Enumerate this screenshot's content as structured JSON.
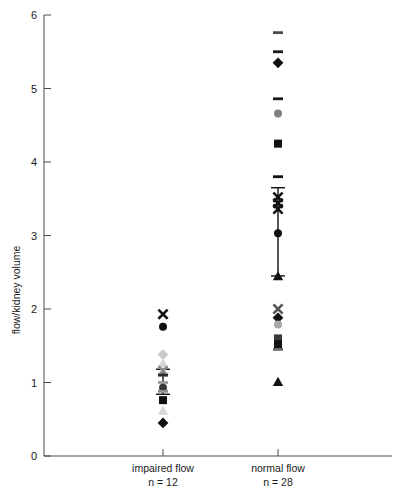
{
  "chart_data": {
    "type": "scatter",
    "title": "",
    "xlabel": "",
    "ylabel": "flow/kidney volume",
    "ylim": [
      0,
      6
    ],
    "yticks": [
      0,
      1,
      2,
      3,
      4,
      5,
      6
    ],
    "ytick_labels": [
      "0",
      "1",
      "2",
      "3",
      "4",
      "5",
      "6"
    ],
    "grid": false,
    "legend": "none",
    "categories": [
      "impaired flow",
      "normal flow"
    ],
    "category_sublabels": [
      "n = 12",
      "n = 28"
    ],
    "groups": [
      {
        "name": "impaired flow",
        "n": 12,
        "x_position": 163,
        "points": [
          {
            "value": 1.93,
            "marker": "x",
            "color": "#111111"
          },
          {
            "value": 1.76,
            "marker": "circle",
            "color": "#111111"
          },
          {
            "value": 1.38,
            "marker": "diamond",
            "color": "#c9c9c9"
          },
          {
            "value": 1.26,
            "marker": "triangle",
            "color": "#d5d5d5"
          },
          {
            "value": 1.16,
            "marker": "x",
            "color": "#8a8a8a"
          },
          {
            "value": 1.1,
            "marker": "dash",
            "color": "#2b2b2b"
          },
          {
            "value": 1.0,
            "marker": "dash",
            "color": "#9a9a9a"
          },
          {
            "value": 0.93,
            "marker": "circle",
            "color": "#3a3a3a"
          },
          {
            "value": 0.88,
            "marker": "dash",
            "color": "#8f8f8f"
          },
          {
            "value": 0.76,
            "marker": "square",
            "color": "#111111"
          },
          {
            "value": 0.62,
            "marker": "triangle",
            "color": "#d8d8d8"
          },
          {
            "value": 0.45,
            "marker": "diamond",
            "color": "#111111"
          }
        ],
        "error_bar": {
          "mean": 1.02,
          "upper": 1.18,
          "lower": 0.84
        }
      },
      {
        "name": "normal flow",
        "n": 28,
        "x_position": 278,
        "points": [
          {
            "value": 5.76,
            "marker": "dash",
            "color": "#4a4a4a"
          },
          {
            "value": 5.5,
            "marker": "dash",
            "color": "#1a1a1a"
          },
          {
            "value": 5.35,
            "marker": "diamond",
            "color": "#111111"
          },
          {
            "value": 4.86,
            "marker": "dash",
            "color": "#1a1a1a"
          },
          {
            "value": 4.66,
            "marker": "circle",
            "color": "#808080"
          },
          {
            "value": 4.25,
            "marker": "square",
            "color": "#111111"
          },
          {
            "value": 3.8,
            "marker": "dash",
            "color": "#111111"
          },
          {
            "value": 3.52,
            "marker": "x",
            "color": "#111111"
          },
          {
            "value": 3.44,
            "marker": "x",
            "color": "#111111"
          },
          {
            "value": 3.36,
            "marker": "x",
            "color": "#111111"
          },
          {
            "value": 3.03,
            "marker": "circle",
            "color": "#111111"
          },
          {
            "value": 2.45,
            "marker": "triangle",
            "color": "#111111"
          },
          {
            "value": 2.0,
            "marker": "x",
            "color": "#555555"
          },
          {
            "value": 1.88,
            "marker": "diamond",
            "color": "#111111"
          },
          {
            "value": 1.79,
            "marker": "circle",
            "color": "#a8a8a8"
          },
          {
            "value": 1.6,
            "marker": "square",
            "color": "#3a3a3a"
          },
          {
            "value": 1.52,
            "marker": "square",
            "color": "#111111"
          },
          {
            "value": 1.45,
            "marker": "dash",
            "color": "#6a6a6a"
          },
          {
            "value": 1.01,
            "marker": "triangle",
            "color": "#111111"
          }
        ],
        "error_bar": {
          "mean": 3.03,
          "upper": 3.65,
          "lower": 2.45
        }
      }
    ]
  },
  "axis": {
    "y_title": "flow/kidney volume",
    "y_tick_0": "0",
    "y_tick_1": "1",
    "y_tick_2": "2",
    "y_tick_3": "3",
    "y_tick_4": "4",
    "y_tick_5": "5",
    "y_tick_6": "6"
  },
  "x_categories": {
    "left_label": "impaired flow",
    "left_n": "n = 12",
    "right_label": "normal flow",
    "right_n": "n = 28"
  }
}
